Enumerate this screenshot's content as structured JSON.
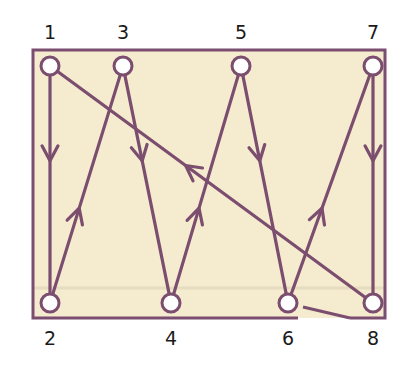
{
  "colors": {
    "stroke": "#7b4d6e",
    "frame_fill": "#f5ebcf",
    "node_fill": "#ffffff",
    "label": "#1a1a1a"
  },
  "frame": {
    "x": 33,
    "y": 50,
    "width": 352,
    "height": 268,
    "bottom_gap_start_x": 298
  },
  "nodes": [
    {
      "id": "1",
      "label": "1",
      "x": 50,
      "y": 66,
      "row": "top"
    },
    {
      "id": "2",
      "label": "2",
      "x": 50,
      "y": 303,
      "row": "bottom"
    },
    {
      "id": "3",
      "label": "3",
      "x": 123,
      "y": 66,
      "row": "top"
    },
    {
      "id": "4",
      "label": "4",
      "x": 171,
      "y": 303,
      "row": "bottom"
    },
    {
      "id": "5",
      "label": "5",
      "x": 241,
      "y": 66,
      "row": "top"
    },
    {
      "id": "6",
      "label": "6",
      "x": 288,
      "y": 303,
      "row": "bottom"
    },
    {
      "id": "7",
      "label": "7",
      "x": 373,
      "y": 66,
      "row": "top"
    },
    {
      "id": "8",
      "label": "8",
      "x": 373,
      "y": 303,
      "row": "bottom"
    }
  ],
  "edges": [
    {
      "from": "1",
      "to": "2"
    },
    {
      "from": "2",
      "to": "3"
    },
    {
      "from": "3",
      "to": "4"
    },
    {
      "from": "4",
      "to": "5"
    },
    {
      "from": "5",
      "to": "6"
    },
    {
      "from": "6",
      "to": "7"
    },
    {
      "from": "7",
      "to": "8"
    },
    {
      "from": "8",
      "to": "1"
    }
  ],
  "extra_line": {
    "x1": 303,
    "y1": 307,
    "x2": 350,
    "y2": 318
  }
}
